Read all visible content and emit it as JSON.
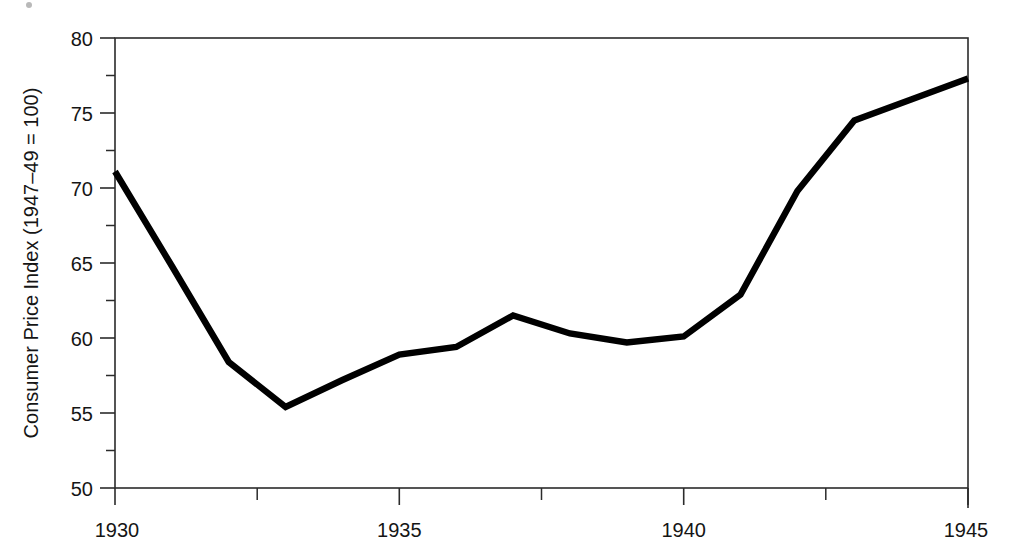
{
  "chart_data": {
    "type": "line",
    "title": "",
    "subtitle": "",
    "xlabel": "",
    "ylabel": "Consumer Price Index (1947–49 = 100)",
    "x": [
      1930,
      1931,
      1932,
      1933,
      1934,
      1935,
      1936,
      1937,
      1938,
      1939,
      1940,
      1941,
      1942,
      1943,
      1944,
      1945
    ],
    "values": [
      71.1,
      64.8,
      58.4,
      55.4,
      57.2,
      58.9,
      59.4,
      61.5,
      60.3,
      59.7,
      60.1,
      62.9,
      69.8,
      74.5,
      75.9,
      77.3
    ],
    "series": [
      {
        "name": "Consumer Price Index",
        "values": [
          71.1,
          64.8,
          58.4,
          55.4,
          57.2,
          58.9,
          59.4,
          61.5,
          60.3,
          59.7,
          60.1,
          62.9,
          69.8,
          74.5,
          75.9,
          77.3
        ]
      }
    ],
    "xlim": [
      1930,
      1945
    ],
    "ylim": [
      50,
      80
    ],
    "x_major_ticks": [
      1930,
      1935,
      1940,
      1945
    ],
    "x_major_tick_labels": [
      "1930",
      "1935",
      "1940",
      "1945"
    ],
    "x_minor_ticks": [
      1932.5,
      1937.5,
      1942.5
    ],
    "y_major_ticks": [
      50,
      55,
      60,
      65,
      70,
      75,
      80
    ],
    "y_major_tick_labels": [
      "50",
      "55",
      "60",
      "65",
      "70",
      "75",
      "80"
    ],
    "y_minor_ticks": [
      52.5,
      57.5,
      62.5,
      67.5,
      72.5,
      77.5
    ],
    "grid": false,
    "legend": false,
    "legend_position": "none",
    "line_color": "#000000",
    "axis_color": "#2b2b2b",
    "background_color": "#ffffff",
    "annotations": []
  }
}
